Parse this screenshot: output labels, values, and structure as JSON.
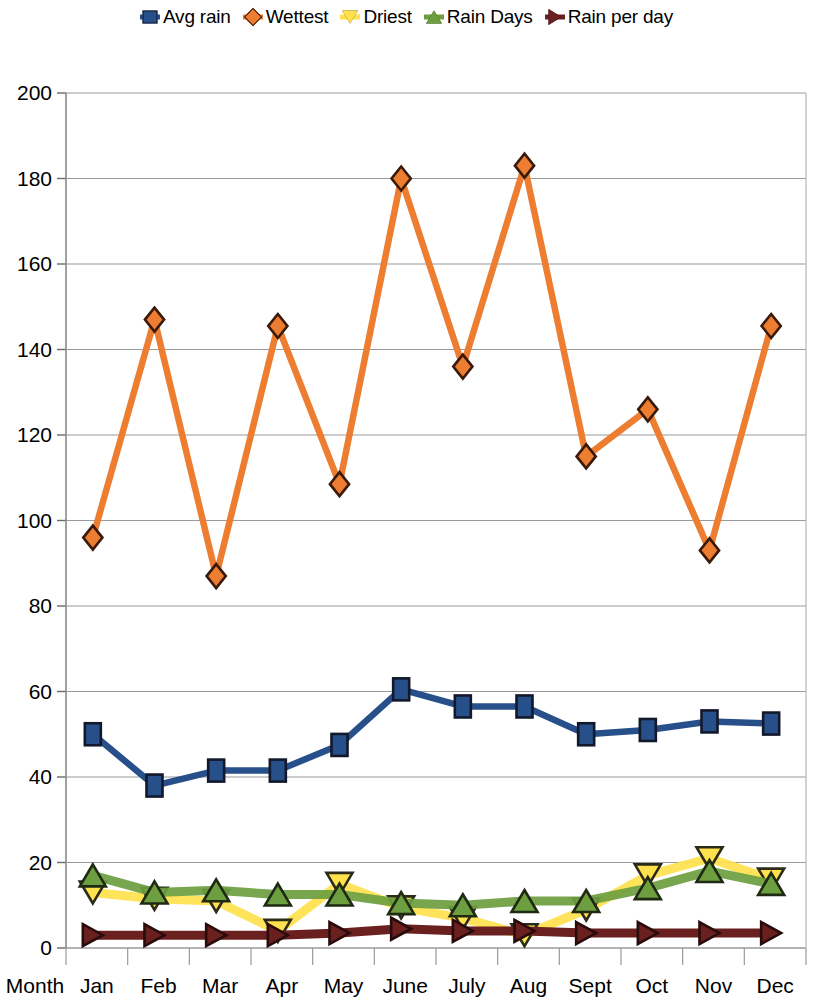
{
  "legend": {
    "position": "top-center",
    "items": [
      {
        "label": "Avg rain",
        "marker": "square-marker",
        "color": "#27508b",
        "outline": "#13182b"
      },
      {
        "label": "Wettest",
        "marker": "diamond-marker",
        "color": "#ed7d31",
        "outline": "#3a1a0a"
      },
      {
        "label": "Driest",
        "marker": "triangle-down-marker",
        "color": "#ffe14d",
        "outline": "#2b2b1a"
      },
      {
        "label": "Rain Days",
        "marker": "triangle-up-marker",
        "color": "#6d9e3f",
        "outline": "#1f2a12"
      },
      {
        "label": "Rain per day",
        "marker": "triangle-right-marker",
        "color": "#6b2020",
        "outline": "#2a0b0b"
      }
    ]
  },
  "axes": {
    "x_corner_label": "Month",
    "y_ticks": [
      0,
      20,
      40,
      60,
      80,
      100,
      120,
      140,
      160,
      180,
      200
    ],
    "x_ticks": [
      "Jan",
      "Feb",
      "Mar",
      "Apr",
      "May",
      "June",
      "July",
      "Aug",
      "Sept",
      "Oct",
      "Nov",
      "Dec"
    ],
    "ylim": [
      0,
      200
    ],
    "grid": "horizontal"
  },
  "chart_data": {
    "type": "line",
    "title": "",
    "xlabel": "Month",
    "ylabel": "",
    "ylim": [
      0,
      200
    ],
    "grid": true,
    "legend_position": "top",
    "categories": [
      "Jan",
      "Feb",
      "Mar",
      "Apr",
      "May",
      "June",
      "July",
      "Aug",
      "Sept",
      "Oct",
      "Nov",
      "Dec"
    ],
    "series": [
      {
        "name": "Avg rain",
        "color": "#27508b",
        "marker": "square",
        "values": [
          50,
          38,
          41.5,
          41.5,
          47.5,
          60.5,
          56.5,
          56.5,
          50,
          51,
          53,
          52.5
        ]
      },
      {
        "name": "Wettest",
        "color": "#ed7d31",
        "marker": "diamond",
        "values": [
          96,
          147,
          87,
          145.5,
          108.5,
          180,
          136,
          183,
          115,
          126,
          93,
          145.5
        ]
      },
      {
        "name": "Driest",
        "color": "#ffe14d",
        "marker": "triangle-down",
        "values": [
          13,
          11.5,
          11,
          4,
          15,
          9.5,
          7,
          3,
          9,
          17,
          21,
          16
        ]
      },
      {
        "name": "Rain Days",
        "color": "#6d9e3f",
        "marker": "triangle-up",
        "values": [
          17,
          13,
          13.5,
          12.5,
          12.5,
          10.5,
          10,
          11,
          11,
          14,
          18,
          15
        ]
      },
      {
        "name": "Rain per day",
        "color": "#6b2020",
        "marker": "triangle-right",
        "values": [
          3,
          3,
          3,
          3,
          3.5,
          4.5,
          4,
          4,
          3.5,
          3.5,
          3.5,
          3.5
        ]
      }
    ]
  }
}
